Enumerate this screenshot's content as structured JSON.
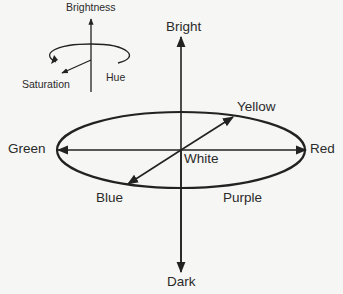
{
  "legend": {
    "brightness": "Brightness",
    "hue": "Hue",
    "saturation": "Saturation"
  },
  "diagram": {
    "bright": "Bright",
    "dark": "Dark",
    "green": "Green",
    "red": "Red",
    "yellow": "Yellow",
    "blue": "Blue",
    "purple": "Purple",
    "white": "White"
  },
  "colors": {
    "background": "#f6f6f4",
    "stroke": "#222222",
    "text": "#2a2a2a"
  }
}
